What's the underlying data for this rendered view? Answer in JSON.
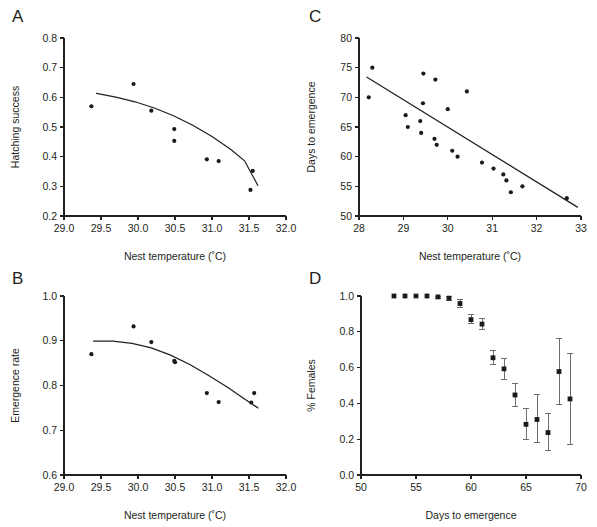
{
  "figure": {
    "background": "#ffffff",
    "point_color": "#1a1a1a",
    "line_color": "#231f20",
    "error_bar_color": "#6e6e6e"
  },
  "panels": [
    {
      "letter": "A",
      "chart_data": {
        "type": "scatter",
        "title": "",
        "xlabel": "Nest temperature (˚C)",
        "ylabel": "Hatching success",
        "xlim": [
          29.0,
          32.0
        ],
        "ylim": [
          0.2,
          0.8
        ],
        "xticks": [
          29.0,
          29.5,
          30.0,
          30.5,
          31.0,
          31.5,
          32.0
        ],
        "xticklabels": [
          "29.0",
          "29.5",
          "30.0",
          "30.5",
          "31.0",
          "31.5",
          "32.0"
        ],
        "yticks": [
          0.2,
          0.3,
          0.4,
          0.5,
          0.6,
          0.7,
          0.8
        ],
        "yticklabels": [
          "0.2",
          "0.3",
          "0.4",
          "0.5",
          "0.6",
          "0.7",
          "0.8"
        ],
        "grid": false,
        "legend": "none",
        "points": [
          {
            "x": 29.37,
            "y": 0.57
          },
          {
            "x": 29.94,
            "y": 0.645
          },
          {
            "x": 30.18,
            "y": 0.555
          },
          {
            "x": 30.49,
            "y": 0.493
          },
          {
            "x": 30.49,
            "y": 0.453
          },
          {
            "x": 30.93,
            "y": 0.391
          },
          {
            "x": 31.09,
            "y": 0.385
          },
          {
            "x": 31.55,
            "y": 0.352
          },
          {
            "x": 31.52,
            "y": 0.288
          }
        ],
        "fit_curve": {
          "name": "quadratic fit",
          "x_start": 29.44,
          "x_end": 31.62,
          "points": [
            {
              "x": 29.44,
              "y": 0.613
            },
            {
              "x": 29.7,
              "y": 0.601
            },
            {
              "x": 29.96,
              "y": 0.585
            },
            {
              "x": 30.22,
              "y": 0.564
            },
            {
              "x": 30.48,
              "y": 0.538
            },
            {
              "x": 30.74,
              "y": 0.506
            },
            {
              "x": 31.0,
              "y": 0.468
            },
            {
              "x": 31.26,
              "y": 0.423
            },
            {
              "x": 31.44,
              "y": 0.386
            },
            {
              "x": 31.62,
              "y": 0.303
            }
          ]
        }
      }
    },
    {
      "letter": "B",
      "chart_data": {
        "type": "scatter",
        "title": "",
        "xlabel": "Nest temperature (˚C)",
        "ylabel": "Emergence rate",
        "xlim": [
          29.0,
          32.0
        ],
        "ylim": [
          0.6,
          1.0
        ],
        "xticks": [
          29.0,
          29.5,
          30.0,
          30.5,
          31.0,
          31.5,
          32.0
        ],
        "xticklabels": [
          "29.0",
          "29.5",
          "30.0",
          "30.5",
          "31.0",
          "31.5",
          "32.0"
        ],
        "yticks": [
          0.6,
          0.7,
          0.8,
          0.9,
          1.0
        ],
        "yticklabels": [
          "0.6",
          "0.7",
          "0.8",
          "0.9",
          "1.0"
        ],
        "grid": false,
        "legend": "none",
        "points": [
          {
            "x": 29.37,
            "y": 0.87
          },
          {
            "x": 29.94,
            "y": 0.932
          },
          {
            "x": 30.18,
            "y": 0.897
          },
          {
            "x": 30.49,
            "y": 0.855
          },
          {
            "x": 30.5,
            "y": 0.852
          },
          {
            "x": 30.93,
            "y": 0.783
          },
          {
            "x": 31.09,
            "y": 0.763
          },
          {
            "x": 31.53,
            "y": 0.762
          },
          {
            "x": 31.57,
            "y": 0.783
          }
        ],
        "fit_curve": {
          "name": "quadratic fit",
          "x_start": 29.4,
          "x_end": 31.62,
          "points": [
            {
              "x": 29.4,
              "y": 0.899
            },
            {
              "x": 29.66,
              "y": 0.899
            },
            {
              "x": 29.92,
              "y": 0.894
            },
            {
              "x": 30.18,
              "y": 0.884
            },
            {
              "x": 30.44,
              "y": 0.868
            },
            {
              "x": 30.7,
              "y": 0.847
            },
            {
              "x": 30.96,
              "y": 0.822
            },
            {
              "x": 31.22,
              "y": 0.795
            },
            {
              "x": 31.42,
              "y": 0.772
            },
            {
              "x": 31.62,
              "y": 0.75
            }
          ]
        }
      }
    },
    {
      "letter": "C",
      "chart_data": {
        "type": "scatter",
        "title": "",
        "xlabel": "Nest temperature (˚C)",
        "ylabel": "Days to emergence",
        "xlim": [
          28.0,
          33.0
        ],
        "ylim": [
          50,
          80
        ],
        "xticks": [
          28,
          29,
          30,
          31,
          32,
          33
        ],
        "xticklabels": [
          "28",
          "29",
          "30",
          "31",
          "32",
          "33"
        ],
        "yticks": [
          50,
          55,
          60,
          65,
          70,
          75,
          80
        ],
        "yticklabels": [
          "50",
          "55",
          "60",
          "65",
          "70",
          "75",
          "80"
        ],
        "grid": false,
        "legend": "none",
        "points": [
          {
            "x": 28.3,
            "y": 75
          },
          {
            "x": 28.22,
            "y": 70
          },
          {
            "x": 29.05,
            "y": 67
          },
          {
            "x": 29.1,
            "y": 65
          },
          {
            "x": 29.38,
            "y": 66
          },
          {
            "x": 29.4,
            "y": 64
          },
          {
            "x": 29.45,
            "y": 74
          },
          {
            "x": 29.44,
            "y": 69
          },
          {
            "x": 29.72,
            "y": 73
          },
          {
            "x": 29.7,
            "y": 63
          },
          {
            "x": 29.75,
            "y": 62
          },
          {
            "x": 30.0,
            "y": 68
          },
          {
            "x": 30.1,
            "y": 61
          },
          {
            "x": 30.22,
            "y": 60
          },
          {
            "x": 30.43,
            "y": 71
          },
          {
            "x": 30.77,
            "y": 59
          },
          {
            "x": 31.03,
            "y": 58
          },
          {
            "x": 31.25,
            "y": 57
          },
          {
            "x": 31.32,
            "y": 56
          },
          {
            "x": 31.42,
            "y": 54
          },
          {
            "x": 31.68,
            "y": 55
          },
          {
            "x": 32.68,
            "y": 53
          }
        ],
        "fit_curve": {
          "name": "linear fit",
          "x_start": 28.18,
          "x_end": 32.92,
          "points": [
            {
              "x": 28.18,
              "y": 73.4
            },
            {
              "x": 32.92,
              "y": 51.5
            }
          ]
        }
      }
    },
    {
      "letter": "D",
      "chart_data": {
        "type": "scatter",
        "title": "",
        "xlabel": "Days to emergence",
        "ylabel": "% Females",
        "xlim": [
          50,
          70
        ],
        "ylim": [
          0.0,
          1.0
        ],
        "xticks": [
          50,
          55,
          60,
          65,
          70
        ],
        "xticklabels": [
          "50",
          "55",
          "60",
          "65",
          "70"
        ],
        "yticks": [
          0.0,
          0.2,
          0.4,
          0.6,
          0.8,
          1.0
        ],
        "yticklabels": [
          "0.0",
          "0.2",
          "0.4",
          "0.6",
          "0.8",
          "1.0"
        ],
        "grid": false,
        "legend": "none",
        "has_error_bars": true,
        "points": [
          {
            "x": 53,
            "y": 1.0,
            "err_low": 1.0,
            "err_high": 1.0
          },
          {
            "x": 54,
            "y": 1.0,
            "err_low": 1.0,
            "err_high": 1.0
          },
          {
            "x": 55,
            "y": 1.0,
            "err_low": 1.0,
            "err_high": 1.0
          },
          {
            "x": 56,
            "y": 1.0,
            "err_low": 1.0,
            "err_high": 1.0
          },
          {
            "x": 57,
            "y": 0.995,
            "err_low": 0.985,
            "err_high": 1.0
          },
          {
            "x": 58,
            "y": 0.988,
            "err_low": 0.975,
            "err_high": 1.0
          },
          {
            "x": 59,
            "y": 0.958,
            "err_low": 0.938,
            "err_high": 0.978
          },
          {
            "x": 60,
            "y": 0.868,
            "err_low": 0.845,
            "err_high": 0.895
          },
          {
            "x": 61,
            "y": 0.843,
            "err_low": 0.815,
            "err_high": 0.872
          },
          {
            "x": 62,
            "y": 0.655,
            "err_low": 0.615,
            "err_high": 0.695
          },
          {
            "x": 63,
            "y": 0.593,
            "err_low": 0.535,
            "err_high": 0.65
          },
          {
            "x": 64,
            "y": 0.447,
            "err_low": 0.38,
            "err_high": 0.512
          },
          {
            "x": 65,
            "y": 0.283,
            "err_low": 0.198,
            "err_high": 0.37
          },
          {
            "x": 66,
            "y": 0.31,
            "err_low": 0.18,
            "err_high": 0.447
          },
          {
            "x": 67,
            "y": 0.237,
            "err_low": 0.138,
            "err_high": 0.345
          },
          {
            "x": 68,
            "y": 0.578,
            "err_low": 0.392,
            "err_high": 0.76
          },
          {
            "x": 69,
            "y": 0.425,
            "err_low": 0.17,
            "err_high": 0.678
          }
        ]
      }
    }
  ]
}
